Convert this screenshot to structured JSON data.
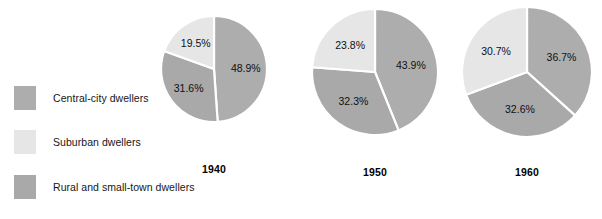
{
  "legend": {
    "items": [
      {
        "label": "Central-city dwellers",
        "color": "#adadad",
        "key": "central-city"
      },
      {
        "label": "Suburban dwellers",
        "color": "#e6e6e6",
        "key": "suburban"
      },
      {
        "label": "Rural and small-town dwellers",
        "color": "#a9a9a9",
        "key": "rural"
      }
    ]
  },
  "chart_data": {
    "type": "pie",
    "title": "",
    "subtitle": "",
    "xlabel": "",
    "ylabel": "",
    "legend_position": "left",
    "grid": false,
    "value_suffix": "%",
    "categories": [
      "Central-city dwellers",
      "Suburban dwellers",
      "Rural and small-town dwellers"
    ],
    "colors": [
      "#adadad",
      "#e6e6e6",
      "#a9a9a9"
    ],
    "charts": [
      {
        "title": "1940",
        "slices": [
          {
            "name": "Central-city dwellers",
            "value": 48.9,
            "label": "48.9%",
            "color": "#adadad"
          },
          {
            "name": "Rural and small-town dwellers",
            "value": 31.6,
            "label": "31.6%",
            "color": "#a9a9a9"
          },
          {
            "name": "Suburban dwellers",
            "value": 19.5,
            "label": "19.5%",
            "color": "#e6e6e6"
          }
        ]
      },
      {
        "title": "1950",
        "slices": [
          {
            "name": "Central-city dwellers",
            "value": 43.9,
            "label": "43.9%",
            "color": "#adadad"
          },
          {
            "name": "Rural and small-town dwellers",
            "value": 32.3,
            "label": "32.3%",
            "color": "#a9a9a9"
          },
          {
            "name": "Suburban dwellers",
            "value": 23.8,
            "label": "23.8%",
            "color": "#e6e6e6"
          }
        ]
      },
      {
        "title": "1960",
        "slices": [
          {
            "name": "Central-city dwellers",
            "value": 36.7,
            "label": "36.7%",
            "color": "#adadad"
          },
          {
            "name": "Rural and small-town dwellers",
            "value": 32.6,
            "label": "32.6%",
            "color": "#a9a9a9"
          },
          {
            "name": "Suburban dwellers",
            "value": 30.7,
            "label": "30.7%",
            "color": "#e6e6e6"
          }
        ]
      }
    ]
  },
  "layout": {
    "pies": [
      {
        "cx": 214,
        "cy": 69,
        "r": 53,
        "label_y": 163,
        "label_r": 0.6
      },
      {
        "cx": 375,
        "cy": 72,
        "r": 63,
        "label_y": 166,
        "label_r": 0.58
      },
      {
        "cx": 527,
        "cy": 72,
        "r": 65,
        "label_y": 166,
        "label_r": 0.58
      }
    ]
  }
}
